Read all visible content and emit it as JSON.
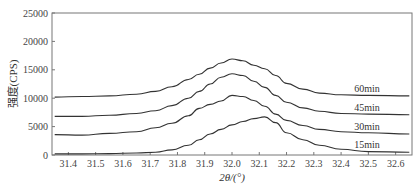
{
  "chart_data": {
    "type": "line",
    "title": "",
    "xlabel": "2θ/(°)",
    "ylabel": "强度(CPS)",
    "xlim": [
      31.34,
      32.66
    ],
    "ylim": [
      0,
      25000
    ],
    "grid": false,
    "legend_position": "inline labels at right end of each curve",
    "x_ticks": [
      "31.4",
      "31.5",
      "31.6",
      "31.7",
      "31.8",
      "31.9",
      "32.0",
      "32.1",
      "32.2",
      "32.3",
      "32.4",
      "32.5",
      "32.6"
    ],
    "y_ticks": [
      "0",
      "5000",
      "10000",
      "15000",
      "20000",
      "25000"
    ],
    "x": [
      31.35,
      31.45,
      31.55,
      31.65,
      31.72,
      31.78,
      31.84,
      31.88,
      31.92,
      31.96,
      32.0,
      32.04,
      32.08,
      32.12,
      32.16,
      32.2,
      32.26,
      32.32,
      32.4,
      32.5,
      32.65
    ],
    "series": [
      {
        "name": "60min",
        "label": "60min",
        "values": [
          10200,
          10300,
          10400,
          10700,
          11200,
          12000,
          13300,
          14200,
          15300,
          16200,
          16900,
          16600,
          15800,
          15200,
          14000,
          12600,
          11600,
          10900,
          10600,
          10500,
          10400
        ]
      },
      {
        "name": "45min",
        "label": "45min",
        "values": [
          6800,
          6800,
          7000,
          7300,
          7800,
          8700,
          10000,
          11200,
          12500,
          13700,
          14300,
          14000,
          13000,
          11900,
          10500,
          9300,
          8300,
          7700,
          7300,
          7200,
          7100
        ]
      },
      {
        "name": "30min",
        "label": "30min",
        "values": [
          3600,
          3500,
          3800,
          4100,
          4800,
          5600,
          6900,
          8200,
          8900,
          9500,
          10500,
          10300,
          9600,
          8600,
          7200,
          6100,
          5200,
          4500,
          4100,
          3900,
          3700
        ]
      },
      {
        "name": "15min",
        "label": "15min",
        "values": [
          200,
          200,
          250,
          350,
          500,
          900,
          1700,
          2700,
          3700,
          4500,
          5300,
          5900,
          6400,
          6700,
          5700,
          3900,
          2700,
          1700,
          1000,
          600,
          500
        ]
      }
    ]
  }
}
